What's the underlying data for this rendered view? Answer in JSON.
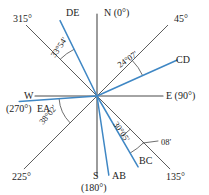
{
  "figure": {
    "type": "compass-bearing-diagram",
    "center": {
      "x": 97,
      "y": 96
    },
    "colors": {
      "axis": "#4a4a4a",
      "reference_line": "#4a4a4a",
      "survey_line": "#3f87c4",
      "text": "#1d1d1d",
      "background": "#ffffff"
    },
    "cardinal_labels": [
      {
        "id": "north",
        "text": "N (0°)",
        "x": 104,
        "y": 16
      },
      {
        "id": "east",
        "text": "E (90°)",
        "x": 166,
        "y": 99
      },
      {
        "id": "south",
        "text": "S",
        "x": 93,
        "y": 179
      },
      {
        "id": "south_value",
        "text": "(180°)",
        "x": 81,
        "y": 191
      },
      {
        "id": "west",
        "text": "W",
        "x": 24,
        "y": 99
      },
      {
        "id": "west_value",
        "text": "(270°)",
        "x": 6,
        "y": 112
      }
    ],
    "diagonal_labels": [
      {
        "id": "deg315",
        "text": "315°",
        "x": 13,
        "y": 22
      },
      {
        "id": "deg45",
        "text": "45°",
        "x": 174,
        "y": 22
      },
      {
        "id": "deg135",
        "text": "135°",
        "x": 166,
        "y": 180
      },
      {
        "id": "deg225",
        "text": "225°",
        "x": 12,
        "y": 180
      }
    ],
    "survey_lines": [
      {
        "id": "DE",
        "label": "DE",
        "label_x": 66,
        "label_y": 16,
        "bearing_deg": 333.9,
        "length": 84,
        "color": "#3f87c4"
      },
      {
        "id": "CD",
        "label": "CD",
        "label_x": 176,
        "label_y": 63,
        "bearing_deg": 65.88,
        "length": 88,
        "color": "#3f87c4"
      },
      {
        "id": "BC",
        "label": "BC",
        "label_x": 139,
        "label_y": 164,
        "bearing_deg": 149.92,
        "length": 82,
        "color": "#3f87c4"
      },
      {
        "id": "AB",
        "label": "AB",
        "label_x": 112,
        "label_y": 179,
        "bearing_deg": 171.5,
        "length": 80,
        "color": "#3f87c4"
      },
      {
        "id": "EA",
        "label": "EA",
        "label_x": 37,
        "label_y": 112,
        "bearing_deg": 266.0,
        "length": 78,
        "color": "#3f87c4"
      }
    ],
    "reference_rays": [
      {
        "id": "ray-315",
        "bearing_deg": 315,
        "length": 100
      },
      {
        "id": "ray-45",
        "bearing_deg": 45,
        "length": 100
      },
      {
        "id": "ray-135",
        "bearing_deg": 135,
        "length": 103
      },
      {
        "id": "ray-225",
        "bearing_deg": 225,
        "length": 103
      }
    ],
    "angle_annotations": [
      {
        "id": "ang-DE",
        "text": "33°54′",
        "x": 55,
        "y": 58,
        "rotate": -56,
        "from_deg": 315,
        "to_deg": 333.9,
        "arc_radius": 52
      },
      {
        "id": "ang-CD",
        "text": "24°07′",
        "x": 120,
        "y": 68,
        "rotate": -35,
        "from_deg": 45,
        "to_deg": 65.88,
        "arc_radius": 50
      },
      {
        "id": "ang-BC",
        "text": "30°05′",
        "x": 113,
        "y": 124,
        "rotate": 56,
        "from_deg": 149.92,
        "to_deg": 135,
        "arc_radius": 47
      },
      {
        "id": "ang-EA",
        "text": "38°02′",
        "x": 43,
        "y": 125,
        "rotate": -50,
        "from_deg": 225,
        "to_deg": 266.0,
        "arc_radius": 38
      },
      {
        "id": "ang-extra",
        "text": "08′",
        "x": 161,
        "y": 145,
        "rotate": 0,
        "from_deg": 135,
        "to_deg": 149.92,
        "arc_radius": 66
      }
    ],
    "leader_line": {
      "id": "leader-08",
      "x1": 143,
      "y1": 143,
      "x2": 158,
      "y2": 141
    }
  }
}
